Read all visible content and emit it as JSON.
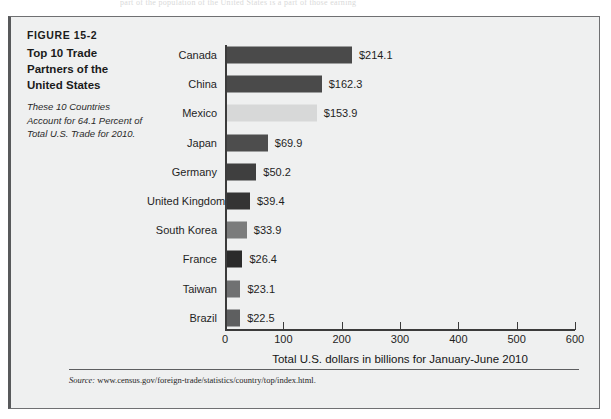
{
  "page": {
    "bleed_text": "part of the population of the United States is a part of those earning"
  },
  "figure": {
    "number": "FIGURE 15-2",
    "title": "Top 10 Trade Partners of the United States",
    "subtitle": "These 10 Countries Account for 64.1 Percent of Total U.S. Trade for 2010.",
    "source_prefix": "Source:",
    "source_url": "www.census.gov/foreign-trade/statistics/country/top/index.html."
  },
  "chart_data": {
    "type": "bar",
    "orientation": "horizontal",
    "title": "Top 10 Trade Partners of the United States",
    "xlabel": "Total U.S. dollars in billions for January-June 2010",
    "ylabel": "",
    "xlim": [
      0,
      600
    ],
    "xticks": [
      0,
      100,
      200,
      300,
      400,
      500,
      600
    ],
    "xtick_labels": [
      "0",
      "100",
      "200",
      "300",
      "400",
      "500",
      "600"
    ],
    "grid": false,
    "legend": null,
    "categories": [
      "Canada",
      "China",
      "Mexico",
      "Japan",
      "Germany",
      "United Kingdom",
      "South Korea",
      "France",
      "Taiwan",
      "Brazil"
    ],
    "values": [
      214.1,
      162.3,
      153.9,
      69.9,
      50.2,
      39.4,
      33.9,
      26.4,
      23.1,
      22.5
    ],
    "value_labels": [
      "$214.1",
      "$162.3",
      "$153.9",
      "$69.9",
      "$50.2",
      "$39.4",
      "$33.9",
      "$26.4",
      "$23.1",
      "$22.5"
    ],
    "bar_colors": [
      "#4a4a4a",
      "#4a4a4a",
      "#d7d8d8",
      "#4d4d4d",
      "#3f3f3f",
      "#343434",
      "#7b7c7c",
      "#2b2b2b",
      "#707172",
      "#5e5f60"
    ]
  }
}
